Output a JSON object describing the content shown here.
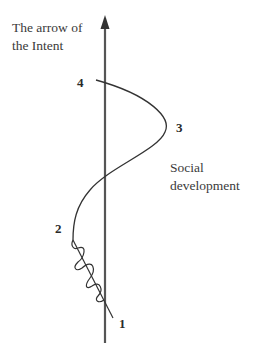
{
  "diagram": {
    "axis_title": {
      "line1": "The arrow of",
      "line2": "the Intent"
    },
    "side_label": {
      "line1": "Social",
      "line2": "development"
    },
    "points": [
      {
        "id": "1",
        "label": "1"
      },
      {
        "id": "2",
        "label": "2"
      },
      {
        "id": "3",
        "label": "3"
      },
      {
        "id": "4",
        "label": "4"
      }
    ],
    "colors": {
      "axis": "#555555",
      "curve": "#333333",
      "text": "#3a3a3a",
      "background": "#ffffff"
    }
  }
}
